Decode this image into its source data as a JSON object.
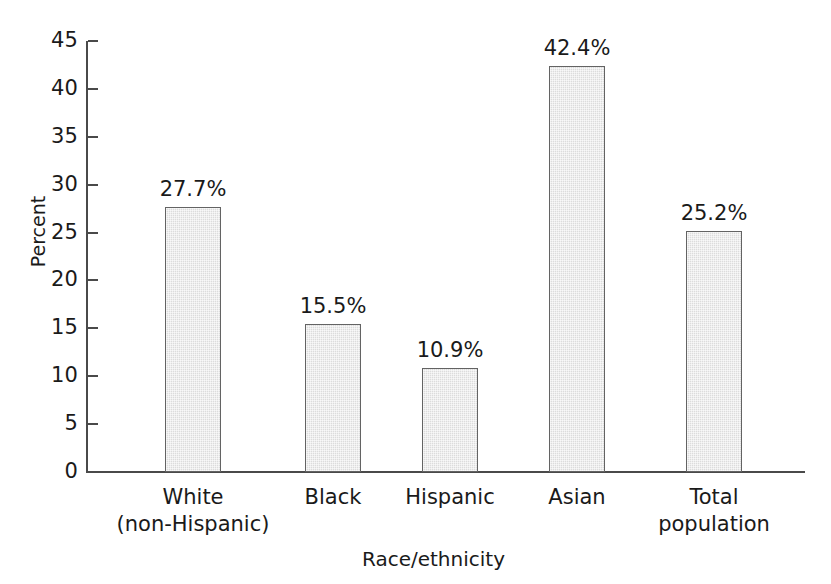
{
  "chart_data": {
    "type": "bar",
    "title": "",
    "subtitle": "",
    "xlabel": "Race/ethnicity",
    "ylabel": "Percent",
    "categories": [
      "White (non-Hispanic)",
      "Black",
      "Hispanic",
      "Asian",
      "Total population"
    ],
    "category_lines": [
      [
        "White",
        "(non-Hispanic)"
      ],
      [
        "Black",
        ""
      ],
      [
        "Hispanic",
        ""
      ],
      [
        "Asian",
        ""
      ],
      [
        "Total",
        "population"
      ]
    ],
    "values": [
      27.7,
      15.5,
      10.9,
      42.4,
      25.2
    ],
    "value_labels": [
      "27.7%",
      "15.5%",
      "10.9%",
      "42.4%",
      "25.2%"
    ],
    "ylim": [
      0,
      45
    ],
    "ytick_step": 5,
    "ytick_labels": [
      "45",
      "40",
      "35",
      "30",
      "25",
      "20",
      "15",
      "10",
      "5",
      "0"
    ],
    "ytick_values": [
      45,
      40,
      35,
      30,
      25,
      20,
      15,
      10,
      5,
      0
    ],
    "grid": false,
    "legend": null,
    "legend_position": "none",
    "colors": {
      "bar_fill": "#dcdcdc",
      "bar_border": "#636363",
      "axis": "#4a4a4a",
      "text": "#1a1a1a",
      "background": "#ffffff"
    }
  }
}
